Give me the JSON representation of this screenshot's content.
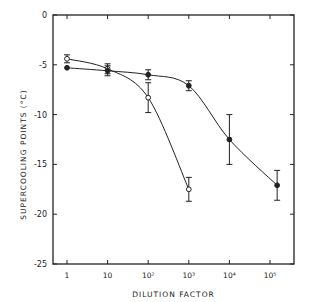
{
  "chart_data": {
    "type": "line",
    "title": "",
    "xlabel": "DILUTION FACTOR",
    "ylabel": "SUPERCOOLING POINTS (°C)",
    "x_scale": "log",
    "x_ticks": [
      "1",
      "10",
      "10²",
      "10³",
      "10⁴",
      "10⁵"
    ],
    "x_tick_values": [
      1,
      10,
      100,
      1000,
      10000,
      100000
    ],
    "y_ticks": [
      "0",
      "-5",
      "-10",
      "-15",
      "-20",
      "-25"
    ],
    "ylim": [
      -25,
      0
    ],
    "grid": false,
    "legend": "none",
    "series": [
      {
        "name": "open circles",
        "marker": "open-circle",
        "x": [
          1,
          10,
          100,
          1000
        ],
        "values": [
          -4.4,
          -5.4,
          -8.3,
          -17.5
        ],
        "error": [
          0.4,
          0.5,
          1.5,
          1.2
        ]
      },
      {
        "name": "filled circles",
        "marker": "filled-circle",
        "x": [
          1,
          10,
          100,
          1000,
          10000,
          150000
        ],
        "values": [
          -5.3,
          -5.6,
          -6.0,
          -7.1,
          -12.5,
          -17.1
        ],
        "error": [
          0,
          0.5,
          0.5,
          0.5,
          2.5,
          1.5
        ]
      }
    ]
  }
}
